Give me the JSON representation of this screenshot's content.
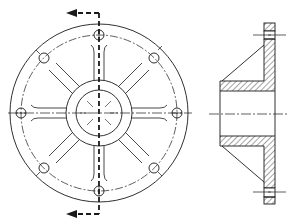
{
  "figure": {
    "stroke_color": "#1a1a1a",
    "background": "#ffffff"
  },
  "front_view": {
    "center": [
      99,
      113
    ],
    "outer_radius": 89,
    "bolt_circle_radius": 78,
    "bolt_count": 8,
    "bolt_hole_radius": 5,
    "hub_outer_radius": 33,
    "hub_inner_radius": 23,
    "rib_count": 8
  },
  "section_cut": {
    "x": 99,
    "top_arrow_y": 13,
    "bottom_arrow_y": 214,
    "arrow_tip_x": 66,
    "direction": "left"
  },
  "side_view": {
    "flange_x": [
      264,
      275
    ],
    "flange_y": [
      23,
      204
    ],
    "hub_x": [
      220,
      274
    ],
    "hub_top_band_y": [
      81,
      91
    ],
    "hub_bottom_band_y": [
      136,
      146
    ],
    "centerline_y": 114,
    "bolt_centerlines_y": [
      35,
      192
    ]
  }
}
